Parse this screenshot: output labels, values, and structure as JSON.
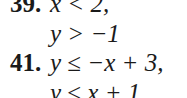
{
  "exercises": [
    {
      "number": "39.",
      "lines": [
        "x < 2,",
        "y > −1"
      ]
    },
    {
      "number": "41.",
      "lines": [
        "y ≤ −x + 3,",
        "y ≤ x + 1"
      ]
    }
  ]
}
